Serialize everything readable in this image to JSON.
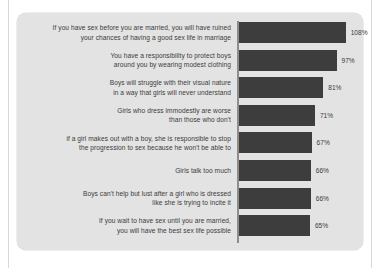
{
  "chart_data": {
    "type": "bar",
    "orientation": "horizontal",
    "title": "",
    "subtitle": "",
    "xlabel": "",
    "ylabel": "",
    "legend": [],
    "grid": false,
    "value_suffix": "%",
    "axis_line": true,
    "bar_color": "#3d3d3d",
    "panel_color": "#e3e3e3",
    "text_color": "#3b3b3b",
    "scale": {
      "px_per_unit": 0.83,
      "offset_px": 17,
      "max_bar_px": 106
    },
    "categories": [
      "If you have sex before you are married, you will have ruined your chances of having a good sex life in marriage",
      "You have a responsibility to protect boys around you by wearing modest clothing",
      "Boys will struggle with their visual nature in a way that girls will never understand",
      "Girls who dress immodestly are worse than those who don't",
      "If a girl makes out with a boy, she is responsible to stop the progression to sex because he won't be able to",
      "Girls talk too much",
      "Boys can't help but lust after a girl who is dressed like she is trying to incite it",
      "If you wait to have sex until you are married, you will have the best sex life possible"
    ],
    "values": [
      108,
      97,
      81,
      71,
      67,
      66,
      66,
      65
    ],
    "value_labels": [
      "108%",
      "97%",
      "81%",
      "71%",
      "67%",
      "66%",
      "66%",
      "65%"
    ]
  },
  "rows": [
    {
      "label_line1": "If you have sex before you are married, you will have ruined",
      "label_line2": "your chances of having a good sex life in marriage",
      "value_label": "108%"
    },
    {
      "label_line1": "You have a responsibility to protect boys",
      "label_line2": "around you by wearing modest clothing",
      "value_label": "97%"
    },
    {
      "label_line1": "Boys will struggle with their visual nature",
      "label_line2": "in a way that girls will never understand",
      "value_label": "81%"
    },
    {
      "label_line1": "Girls who dress immodestly are worse",
      "label_line2": "than those who don't",
      "value_label": "71%"
    },
    {
      "label_line1": "if a girl makes out with a boy, she is responsible to stop",
      "label_line2": "the progression to sex because he won't be able to",
      "value_label": "67%"
    },
    {
      "label_line1": "Girls talk too much",
      "label_line2": "",
      "value_label": "66%"
    },
    {
      "label_line1": "Boys can't help but lust after a girl who is dressed",
      "label_line2": "like she is trying to incite it",
      "value_label": "66%"
    },
    {
      "label_line1": "If you wait to have sex until you are married,",
      "label_line2": "you will have the best sex life possible",
      "value_label": "65%"
    }
  ]
}
